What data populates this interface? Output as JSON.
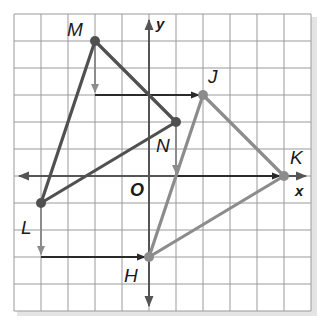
{
  "diagram": {
    "type": "coordinate-plane-translation",
    "grid": {
      "x_min": -5,
      "x_max": 6,
      "y_min": -5,
      "y_max": 6,
      "unit_px": 27,
      "origin_px": [
        149,
        176
      ]
    },
    "axes": {
      "x_label": "x",
      "y_label": "y",
      "origin_label": "O"
    },
    "preimage": {
      "name": "triangle MNL",
      "color": "#505050",
      "vertices": [
        {
          "label": "M",
          "x": -2,
          "y": 5
        },
        {
          "label": "N",
          "x": 1,
          "y": 2
        },
        {
          "label": "L",
          "x": -4,
          "y": -1
        }
      ]
    },
    "image": {
      "name": "triangle JKH",
      "color": "#8c8c8c",
      "vertices": [
        {
          "label": "J",
          "x": 2,
          "y": 3
        },
        {
          "label": "K",
          "x": 5,
          "y": 0
        },
        {
          "label": "H",
          "x": 0,
          "y": -3
        }
      ]
    },
    "translation": {
      "dx": 4,
      "dy": -2
    },
    "labels": {
      "M": "M",
      "N": "N",
      "L": "L",
      "J": "J",
      "K": "K",
      "H": "H",
      "O": "O",
      "x": "x",
      "y": "y"
    }
  }
}
